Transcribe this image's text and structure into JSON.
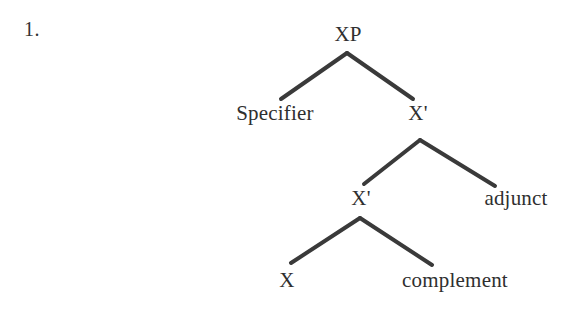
{
  "page": {
    "item_number": "1.",
    "background_color": "#ffffff",
    "ink_color": "#2f2f2f",
    "line_color": "#3a3a3a"
  },
  "diagram": {
    "type": "syntax-tree",
    "nodes": [
      {
        "id": "xp",
        "label": "XP",
        "x": 348,
        "y": 34
      },
      {
        "id": "spec",
        "label": "Specifier",
        "x": 275,
        "y": 113
      },
      {
        "id": "xbar_up",
        "label": "X'",
        "x": 418,
        "y": 113
      },
      {
        "id": "xbar_low",
        "label": "X'",
        "x": 361,
        "y": 198
      },
      {
        "id": "adjunct",
        "label": "adjunct",
        "x": 516,
        "y": 198
      },
      {
        "id": "x_head",
        "label": "X",
        "x": 287,
        "y": 280
      },
      {
        "id": "complement",
        "label": "complement",
        "x": 455,
        "y": 280
      }
    ],
    "edges": [
      {
        "from": "xp",
        "to": "spec",
        "x1": 347,
        "y1": 53,
        "x2": 281,
        "y2": 99
      },
      {
        "from": "xp",
        "to": "xbar_up",
        "x1": 347,
        "y1": 53,
        "x2": 413,
        "y2": 99
      },
      {
        "from": "xbar_up",
        "to": "xbar_low",
        "x1": 420,
        "y1": 140,
        "x2": 364,
        "y2": 184
      },
      {
        "from": "xbar_up",
        "to": "adjunct",
        "x1": 420,
        "y1": 140,
        "x2": 495,
        "y2": 186
      },
      {
        "from": "xbar_low",
        "to": "x_head",
        "x1": 360,
        "y1": 218,
        "x2": 291,
        "y2": 263
      },
      {
        "from": "xbar_low",
        "to": "complement",
        "x1": 360,
        "y1": 218,
        "x2": 432,
        "y2": 265
      }
    ],
    "line_width": 4
  }
}
